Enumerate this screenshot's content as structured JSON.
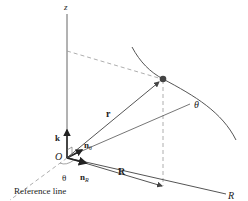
{
  "diagram": {
    "colors": {
      "line": "#555555",
      "dashed": "#888888",
      "particle": "#444444",
      "text": "#222222"
    },
    "labels": {
      "z_axis": "z",
      "origin": "O",
      "k": "k",
      "n_theta": "n",
      "n_theta_sub": "θ",
      "n_R": "n",
      "n_R_sub": "R",
      "r_vector": "r",
      "R_vector": "R",
      "theta_angle": "θ",
      "theta_line": "θ",
      "R_axis": "R",
      "reference_line": "Reference line"
    }
  }
}
